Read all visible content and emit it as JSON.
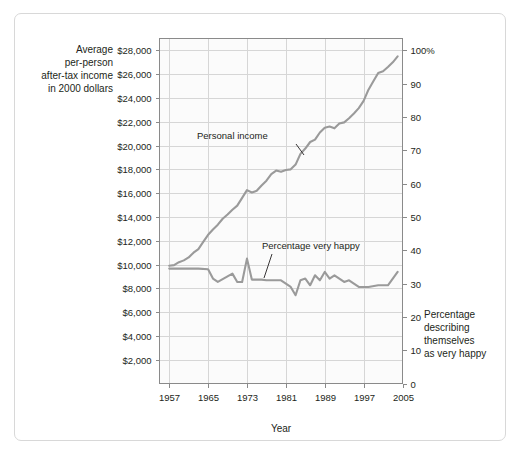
{
  "chart_data": {
    "type": "line",
    "title": "",
    "xlabel": "Year",
    "left_axis": {
      "label_lines": [
        "Average",
        "per-person",
        "after-tax income",
        "in 2000 dollars"
      ],
      "ticks": [
        "$2,000",
        "$4,000",
        "$6,000",
        "$8,000",
        "$10,000",
        "$12,000",
        "$14,000",
        "$16,000",
        "$18,000",
        "$20,000",
        "$22,000",
        "$24,000",
        "$26,000",
        "$28,000"
      ],
      "tick_values": [
        2000,
        4000,
        6000,
        8000,
        10000,
        12000,
        14000,
        16000,
        18000,
        20000,
        22000,
        24000,
        26000,
        28000
      ],
      "ylim": [
        0,
        29000
      ]
    },
    "right_axis": {
      "label_lines": [
        "Percentage",
        "describing",
        "themselves",
        "as very happy"
      ],
      "ticks": [
        "0",
        "10",
        "20",
        "30",
        "40",
        "50",
        "60",
        "70",
        "80",
        "90",
        "100%"
      ],
      "tick_values": [
        0,
        10,
        20,
        30,
        40,
        50,
        60,
        70,
        80,
        90,
        100
      ],
      "ylim": [
        0,
        103.6
      ]
    },
    "xticks": [
      "1957",
      "1965",
      "1973",
      "1981",
      "1989",
      "1997",
      "2005"
    ],
    "xtick_values": [
      1957,
      1965,
      1973,
      1981,
      1989,
      1997,
      2005
    ],
    "xlim": [
      1955,
      2005
    ],
    "grid": true,
    "legend_position": "inline-annotations",
    "line_color": "#9a9a9a",
    "series": [
      {
        "name": "Personal income",
        "axis": "left",
        "annotation": "Personal income",
        "x": [
          1957,
          1958,
          1959,
          1960,
          1961,
          1962,
          1963,
          1964,
          1965,
          1966,
          1967,
          1968,
          1969,
          1970,
          1971,
          1972,
          1973,
          1974,
          1975,
          1976,
          1977,
          1978,
          1979,
          1980,
          1981,
          1982,
          1983,
          1984,
          1985,
          1986,
          1987,
          1988,
          1989,
          1990,
          1991,
          1992,
          1993,
          1994,
          1995,
          1996,
          1997,
          1998,
          1999,
          2000,
          2001,
          2002,
          2003,
          2004
        ],
        "values": [
          9900,
          9950,
          10200,
          10350,
          10600,
          11000,
          11300,
          11900,
          12500,
          12950,
          13350,
          13850,
          14200,
          14600,
          14950,
          15600,
          16250,
          16050,
          16200,
          16650,
          17050,
          17600,
          17900,
          17800,
          17950,
          18000,
          18400,
          19300,
          19750,
          20300,
          20500,
          21100,
          21500,
          21600,
          21450,
          21850,
          21950,
          22300,
          22700,
          23150,
          23750,
          24700,
          25400,
          26100,
          26250,
          26600,
          27000,
          27500
        ]
      },
      {
        "name": "Percentage very happy",
        "axis": "right",
        "annotation": "Percentage very happy",
        "x": [
          1957,
          1960,
          1963,
          1965,
          1966,
          1967,
          1970,
          1971,
          1972,
          1973,
          1974,
          1975,
          1976,
          1977,
          1978,
          1980,
          1982,
          1983,
          1984,
          1985,
          1986,
          1987,
          1988,
          1989,
          1990,
          1991,
          1993,
          1994,
          1996,
          1998,
          2000,
          2002,
          2004
        ],
        "values": [
          34.5,
          34.5,
          34.5,
          34.3,
          31.5,
          30.5,
          33.0,
          30.5,
          30.5,
          37.5,
          31.2,
          31.2,
          31.2,
          31.0,
          31.0,
          31.0,
          29.0,
          26.5,
          31.0,
          31.5,
          29.5,
          32.5,
          31.0,
          33.5,
          31.5,
          32.5,
          30.5,
          31.0,
          29.0,
          29.0,
          29.5,
          29.5,
          33.5
        ]
      }
    ]
  }
}
